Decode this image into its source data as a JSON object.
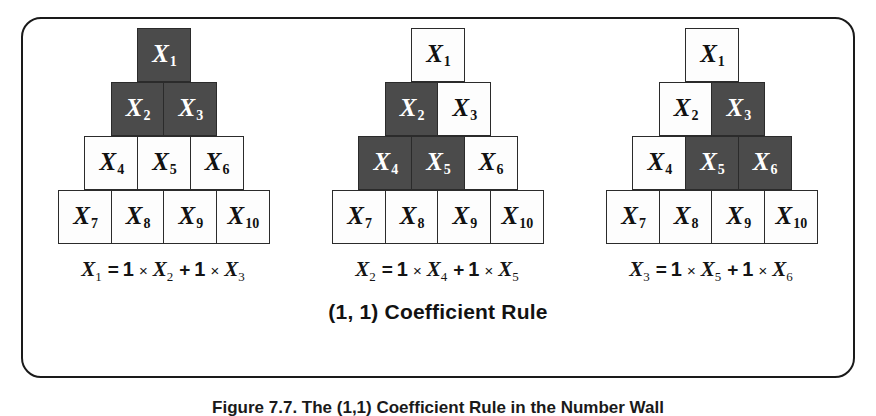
{
  "figure": {
    "rule_caption": "(1, 1) Coefficient Rule",
    "bottom_caption": "Figure 7.7. The (1,1) Coefficient Rule in the Number Wall",
    "frame_border_color": "#1a1a1a",
    "cell_dark_color": "#4b4b4b",
    "cell_light_color": "#fdfdfd",
    "cell_text_light": "#ffffff",
    "cell_text_dark": "#111111"
  },
  "panels": [
    {
      "name": "panel-1",
      "rows": [
        [
          {
            "var": "X",
            "sub": "1",
            "dark": true
          }
        ],
        [
          {
            "var": "X",
            "sub": "2",
            "dark": true
          },
          {
            "var": "X",
            "sub": "3",
            "dark": true
          }
        ],
        [
          {
            "var": "X",
            "sub": "4",
            "dark": false
          },
          {
            "var": "X",
            "sub": "5",
            "dark": false
          },
          {
            "var": "X",
            "sub": "6",
            "dark": false
          }
        ],
        [
          {
            "var": "X",
            "sub": "7",
            "dark": false
          },
          {
            "var": "X",
            "sub": "8",
            "dark": false
          },
          {
            "var": "X",
            "sub": "9",
            "dark": false
          },
          {
            "var": "X",
            "sub": "10",
            "dark": false
          }
        ]
      ],
      "equation": {
        "lhs_var": "X",
        "lhs_sub": "1",
        "equals": "=",
        "coef1": "1",
        "times1": "×",
        "term1_var": "X",
        "term1_sub": "2",
        "plus": "+",
        "coef2": "1",
        "times2": "×",
        "term2_var": "X",
        "term2_sub": "3"
      }
    },
    {
      "name": "panel-2",
      "rows": [
        [
          {
            "var": "X",
            "sub": "1",
            "dark": false
          }
        ],
        [
          {
            "var": "X",
            "sub": "2",
            "dark": true
          },
          {
            "var": "X",
            "sub": "3",
            "dark": false
          }
        ],
        [
          {
            "var": "X",
            "sub": "4",
            "dark": true
          },
          {
            "var": "X",
            "sub": "5",
            "dark": true
          },
          {
            "var": "X",
            "sub": "6",
            "dark": false
          }
        ],
        [
          {
            "var": "X",
            "sub": "7",
            "dark": false
          },
          {
            "var": "X",
            "sub": "8",
            "dark": false
          },
          {
            "var": "X",
            "sub": "9",
            "dark": false
          },
          {
            "var": "X",
            "sub": "10",
            "dark": false
          }
        ]
      ],
      "equation": {
        "lhs_var": "X",
        "lhs_sub": "2",
        "equals": "=",
        "coef1": "1",
        "times1": "×",
        "term1_var": "X",
        "term1_sub": "4",
        "plus": "+",
        "coef2": "1",
        "times2": "×",
        "term2_var": "X",
        "term2_sub": "5"
      }
    },
    {
      "name": "panel-3",
      "rows": [
        [
          {
            "var": "X",
            "sub": "1",
            "dark": false
          }
        ],
        [
          {
            "var": "X",
            "sub": "2",
            "dark": false
          },
          {
            "var": "X",
            "sub": "3",
            "dark": true
          }
        ],
        [
          {
            "var": "X",
            "sub": "4",
            "dark": false
          },
          {
            "var": "X",
            "sub": "5",
            "dark": true
          },
          {
            "var": "X",
            "sub": "6",
            "dark": true
          }
        ],
        [
          {
            "var": "X",
            "sub": "7",
            "dark": false
          },
          {
            "var": "X",
            "sub": "8",
            "dark": false
          },
          {
            "var": "X",
            "sub": "9",
            "dark": false
          },
          {
            "var": "X",
            "sub": "10",
            "dark": false
          }
        ]
      ],
      "equation": {
        "lhs_var": "X",
        "lhs_sub": "3",
        "equals": "=",
        "coef1": "1",
        "times1": "×",
        "term1_var": "X",
        "term1_sub": "5",
        "plus": "+",
        "coef2": "1",
        "times2": "×",
        "term2_var": "X",
        "term2_sub": "6"
      }
    }
  ]
}
